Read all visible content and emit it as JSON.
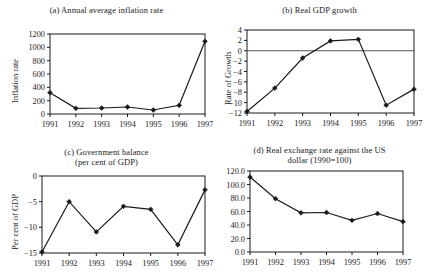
{
  "figure": {
    "years": [
      "1991",
      "1992",
      "1993",
      "1994",
      "1995",
      "1996",
      "1997"
    ]
  },
  "panels": {
    "a": {
      "title": "(a)  Annual average inflation rate",
      "ylabel": "Inflation rate",
      "yticks": [
        "0",
        "200",
        "400",
        "600",
        "800",
        "1000",
        "1200"
      ]
    },
    "b": {
      "title": "(b)  Real GDP growth",
      "ylabel": "Rate of Growth",
      "yticks": [
        "−12",
        "−10",
        "−8",
        "−6",
        "−4",
        "−2",
        "0",
        "2",
        "4"
      ]
    },
    "c": {
      "title_line1": "(c)  Government balance",
      "title_line2": "(per cent of GDP)",
      "ylabel": "Per cent of GDP",
      "yticks": [
        "−15",
        "−10",
        "−5",
        "0"
      ]
    },
    "d": {
      "title_line1": "(d)  Real exchange rate against the US",
      "title_line2": "dollar (1990=100)",
      "ylabel": "",
      "yticks": [
        "0.0",
        "20.0",
        "40.0",
        "60.0",
        "80.0",
        "100.0",
        "120.0"
      ]
    }
  },
  "chart_data": [
    {
      "type": "line",
      "id": "a",
      "title": "(a)  Annual average inflation rate",
      "xlabel": "",
      "ylabel": "Inflation rate",
      "x": [
        "1991",
        "1992",
        "1993",
        "1994",
        "1995",
        "1996",
        "1997"
      ],
      "values": [
        320,
        85,
        90,
        105,
        60,
        130,
        1090
      ],
      "ylim": [
        0,
        1200
      ],
      "ytick_values": [
        0,
        200,
        400,
        600,
        800,
        1000,
        1200
      ],
      "grid": false,
      "legend": false,
      "markers": "filled-diamond"
    },
    {
      "type": "line",
      "id": "b",
      "title": "(b)  Real GDP growth",
      "xlabel": "",
      "ylabel": "Rate of Growth",
      "x": [
        "1991",
        "1992",
        "1993",
        "1994",
        "1995",
        "1996",
        "1997"
      ],
      "values": [
        -11.7,
        -7.2,
        -1.4,
        1.9,
        2.2,
        -10.5,
        -7.4
      ],
      "ylim": [
        -12,
        4
      ],
      "ytick_values": [
        -12,
        -10,
        -8,
        -6,
        -4,
        -2,
        0,
        2,
        4
      ],
      "grid": false,
      "legend": false,
      "zero_line": true,
      "markers": "filled-diamond"
    },
    {
      "type": "line",
      "id": "c",
      "title": "(c)  Government balance (per cent of GDP)",
      "xlabel": "",
      "ylabel": "Per cent of GDP",
      "x": [
        "1991",
        "1992",
        "1993",
        "1994",
        "1995",
        "1996",
        "1997"
      ],
      "values": [
        -14.8,
        -5.0,
        -10.9,
        -5.9,
        -6.5,
        -13.4,
        -2.7
      ],
      "ylim": [
        -15,
        0
      ],
      "ytick_values": [
        -15,
        -10,
        -5,
        0
      ],
      "grid": false,
      "legend": false,
      "markers": "filled-diamond"
    },
    {
      "type": "line",
      "id": "d",
      "title": "(d)  Real exchange rate against the US dollar (1990=100)",
      "xlabel": "",
      "ylabel": "",
      "x": [
        "1991",
        "1992",
        "1993",
        "1994",
        "1995",
        "1996",
        "1997"
      ],
      "values": [
        111.0,
        79.0,
        58.0,
        58.5,
        47.0,
        57.0,
        45.0
      ],
      "ylim": [
        0.0,
        120.0
      ],
      "ytick_values": [
        0.0,
        20.0,
        40.0,
        60.0,
        80.0,
        100.0,
        120.0
      ],
      "grid": false,
      "legend": false,
      "markers": "filled-diamond"
    }
  ]
}
